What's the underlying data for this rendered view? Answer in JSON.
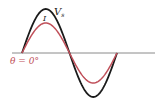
{
  "diagram": {
    "type": "phasor-waveform",
    "axis_color": "#8a8a8a",
    "curves": [
      {
        "name": "Vs",
        "label": "V",
        "subscript": "s",
        "color": "#1a1a1a",
        "amplitude_px": 44
      },
      {
        "name": "I",
        "label": "I",
        "color": "#c0505a",
        "amplitude_px": 30
      }
    ],
    "phase_label": "θ = 0°",
    "phase_label_color": "#c0505a"
  }
}
